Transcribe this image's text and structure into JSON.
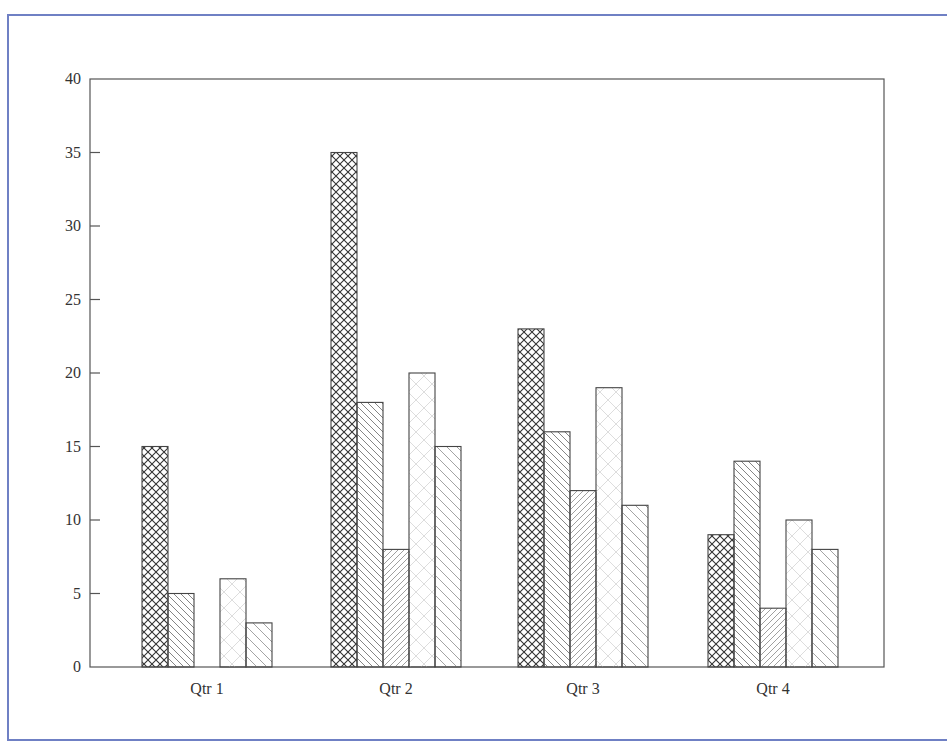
{
  "chart_data": {
    "type": "bar",
    "title": "",
    "xlabel": "",
    "ylabel": "",
    "categories": [
      "Qtr 1",
      "Qtr 2",
      "Qtr 3",
      "Qtr 4"
    ],
    "series": [
      {
        "name": "Series 1",
        "pattern": "crosshatch",
        "values": [
          15,
          35,
          23,
          9
        ]
      },
      {
        "name": "Series 2",
        "pattern": "backslash",
        "values": [
          5,
          18,
          16,
          14
        ]
      },
      {
        "name": "Series 3",
        "pattern": "slash-dense",
        "values": [
          0,
          8,
          12,
          4
        ]
      },
      {
        "name": "Series 4",
        "pattern": "light-cross",
        "values": [
          6,
          20,
          19,
          10
        ]
      },
      {
        "name": "Series 5",
        "pattern": "backslash-sparse",
        "values": [
          3,
          15,
          11,
          8
        ]
      }
    ],
    "ylim": [
      0,
      40
    ],
    "yticks": [
      0,
      5,
      10,
      15,
      20,
      25,
      30,
      35,
      40
    ],
    "grid": false,
    "legend": "none"
  },
  "colors": {
    "frame_border": "#6f80c4",
    "axis": "#555555",
    "bar_outline": "#444444"
  }
}
